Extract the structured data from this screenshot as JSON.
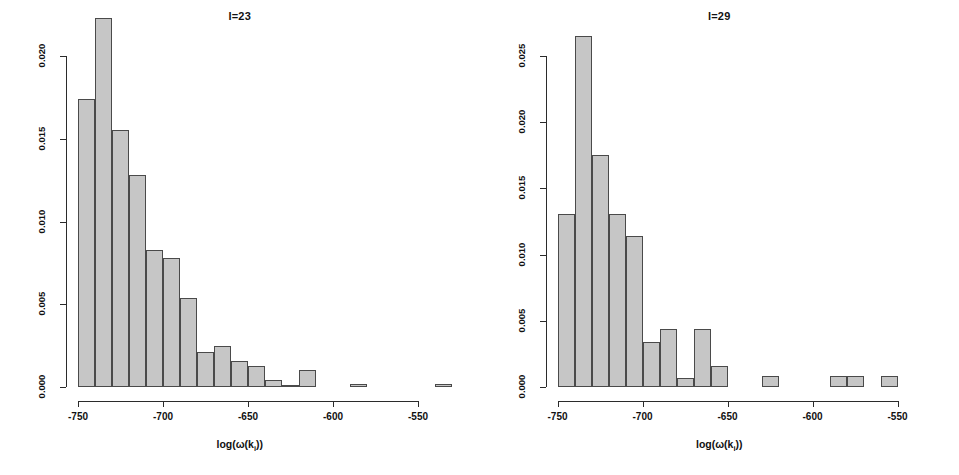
{
  "figure": {
    "background": "#ffffff",
    "bar_fill": "#c6c6c6",
    "bar_stroke": "#4a4a4a",
    "axis_color": "#2b2b2b"
  },
  "panels": [
    {
      "title": "l=23",
      "xlabel_prefix": "log(ω(k",
      "xlabel_sub": "i",
      "xlabel_suffix": "))",
      "xticks": [
        "-750",
        "-700",
        "-650",
        "-600",
        "-550"
      ],
      "yticks": [
        "0.000",
        "0.005",
        "0.010",
        "0.015",
        "0.020"
      ]
    },
    {
      "title": "l=29",
      "xlabel_prefix": "log(ω(k",
      "xlabel_sub": "i",
      "xlabel_suffix": "))",
      "xticks": [
        "-750",
        "-700",
        "-650",
        "-600",
        "-550"
      ],
      "yticks": [
        "0.000",
        "0.005",
        "0.010",
        "0.015",
        "0.020",
        "0.025"
      ]
    }
  ],
  "chart_data": [
    {
      "type": "bar",
      "title": "l=23",
      "xlabel": "log(ω(k_i))",
      "ylabel": "",
      "xlim": [
        -752,
        -530
      ],
      "ylim": [
        0,
        0.0232
      ],
      "ytick_values": [
        0.0,
        0.005,
        0.01,
        0.015,
        0.02
      ],
      "xtick_values": [
        -750,
        -700,
        -650,
        -600,
        -550
      ],
      "bin_width": 10,
      "grid": false,
      "legend": "none",
      "bins": [
        {
          "x0": -750,
          "x1": -740,
          "density": 0.0174
        },
        {
          "x0": -740,
          "x1": -730,
          "density": 0.0223
        },
        {
          "x0": -730,
          "x1": -720,
          "density": 0.0155
        },
        {
          "x0": -720,
          "x1": -710,
          "density": 0.0128
        },
        {
          "x0": -710,
          "x1": -700,
          "density": 0.0083
        },
        {
          "x0": -700,
          "x1": -690,
          "density": 0.0078
        },
        {
          "x0": -690,
          "x1": -680,
          "density": 0.0054
        },
        {
          "x0": -680,
          "x1": -670,
          "density": 0.0021
        },
        {
          "x0": -670,
          "x1": -660,
          "density": 0.0025
        },
        {
          "x0": -660,
          "x1": -650,
          "density": 0.0016
        },
        {
          "x0": -650,
          "x1": -640,
          "density": 0.0013
        },
        {
          "x0": -640,
          "x1": -630,
          "density": 0.0004
        },
        {
          "x0": -630,
          "x1": -620,
          "density": 0.0001
        },
        {
          "x0": -620,
          "x1": -610,
          "density": 0.001
        },
        {
          "x0": -590,
          "x1": -580,
          "density": 0.0002
        },
        {
          "x0": -540,
          "x1": -530,
          "density": 0.0002
        }
      ]
    },
    {
      "type": "bar",
      "title": "l=29",
      "xlabel": "log(ω(k_i))",
      "ylabel": "",
      "xlim": [
        -752,
        -548
      ],
      "ylim": [
        0,
        0.0268
      ],
      "ytick_values": [
        0.0,
        0.005,
        0.01,
        0.015,
        0.02,
        0.025
      ],
      "xtick_values": [
        -750,
        -700,
        -650,
        -600,
        -550
      ],
      "bin_width": 10,
      "grid": false,
      "legend": "none",
      "bins": [
        {
          "x0": -750,
          "x1": -740,
          "density": 0.0131
        },
        {
          "x0": -740,
          "x1": -730,
          "density": 0.0265
        },
        {
          "x0": -730,
          "x1": -720,
          "density": 0.0175
        },
        {
          "x0": -720,
          "x1": -710,
          "density": 0.0131
        },
        {
          "x0": -710,
          "x1": -700,
          "density": 0.0114
        },
        {
          "x0": -700,
          "x1": -690,
          "density": 0.0034
        },
        {
          "x0": -690,
          "x1": -680,
          "density": 0.0044
        },
        {
          "x0": -680,
          "x1": -670,
          "density": 0.0007
        },
        {
          "x0": -670,
          "x1": -660,
          "density": 0.0044
        },
        {
          "x0": -660,
          "x1": -650,
          "density": 0.0016
        },
        {
          "x0": -630,
          "x1": -620,
          "density": 0.0008
        },
        {
          "x0": -590,
          "x1": -580,
          "density": 0.0008
        },
        {
          "x0": -580,
          "x1": -570,
          "density": 0.0008
        },
        {
          "x0": -560,
          "x1": -550,
          "density": 0.0008
        }
      ]
    }
  ]
}
